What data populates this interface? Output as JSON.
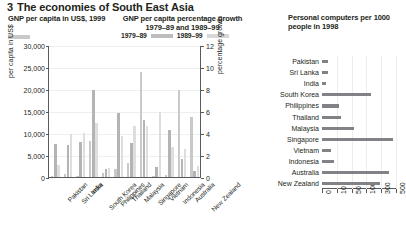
{
  "title": {
    "number": "3",
    "text": "The economies of South East Asia"
  },
  "panels": {
    "left_heading": "GNP per capita in US$, 1999",
    "mid_heading": "GNP per capita percentage growth 1979–89 and 1989–99",
    "right_heading": "Personal computers per 1000 people in 1998"
  },
  "legend": {
    "gnp_label": "",
    "growth_1": "1979–89",
    "growth_2": "1989–99"
  },
  "colors": {
    "gnp": "#c9c9c9",
    "growth_1979_89": "#b4b4b4",
    "growth_1989_99": "#dedede",
    "computers": "#808285",
    "axis": "#58595b",
    "grid": "#efefef",
    "text": "#231f20"
  },
  "chart_data": [
    {
      "type": "bar",
      "title": "GNP per capita in US$, 1999 / GNP per capita percentage growth 1979–89 and 1989–99",
      "xlabel": "",
      "ylabel": "per capita in US$",
      "ylabel_right": "percentage growth",
      "ylim": [
        0,
        30000
      ],
      "yticks": [
        0,
        5000,
        10000,
        15000,
        20000,
        25000,
        30000
      ],
      "yticklabels": [
        "0",
        "5,000",
        "10,000",
        "15,000",
        "20,000",
        "25,000",
        "30,000"
      ],
      "ylim_right": [
        0,
        12
      ],
      "yticks_right": [
        0,
        2,
        4,
        6,
        8,
        10,
        12
      ],
      "yticklabels_right": [
        "0",
        "2",
        "4",
        "6",
        "8",
        "10",
        "12"
      ],
      "grid": true,
      "legend": [
        "1979–89",
        "1989–99"
      ],
      "legend_position": "top",
      "categories": [
        "Pakistan",
        "Sri Lanka",
        "India",
        "South Korea",
        "Philippines",
        "Thailand",
        "Malaysia",
        "Singapore",
        "Vietnam",
        "Indonesia",
        "Australia",
        "New Zealand"
      ],
      "series": [
        {
          "name": "GNP per capita in US$, 1999",
          "axis": "left",
          "values": [
            470,
            820,
            450,
            8490,
            1050,
            1960,
            3400,
            24150,
            370,
            580,
            20050,
            13780
          ]
        },
        {
          "name": "1979–89",
          "axis": "right",
          "values": [
            3.1,
            3.0,
            3.3,
            8.0,
            0.8,
            5.9,
            3.2,
            5.3,
            1.0,
            4.4,
            1.7,
            0.6
          ]
        },
        {
          "name": "1989–99",
          "axis": "right",
          "values": [
            1.2,
            4.0,
            4.1,
            5.0,
            0.9,
            3.8,
            4.7,
            4.7,
            6.0,
            2.8,
            2.6,
            1.1
          ]
        }
      ]
    },
    {
      "type": "bar",
      "orientation": "horizontal",
      "title": "Personal computers per 1000 people in 1998",
      "xlabel": "",
      "ylabel": "",
      "scale": "log-like",
      "xticks": [
        0,
        10,
        50,
        100,
        300,
        500
      ],
      "xticklabels": [
        "0",
        "10",
        "50",
        "100",
        "300",
        "500"
      ],
      "grid": true,
      "categories": [
        "Pakistan",
        "Sri Lanka",
        "India",
        "South Korea",
        "Philippines",
        "Thailand",
        "Malaysia",
        "Singapore",
        "Vietnam",
        "Indonesia",
        "Australia",
        "New Zealand"
      ],
      "values": [
        4,
        4,
        3,
        157,
        15,
        22,
        59,
        458,
        6,
        8,
        412,
        282
      ]
    }
  ]
}
